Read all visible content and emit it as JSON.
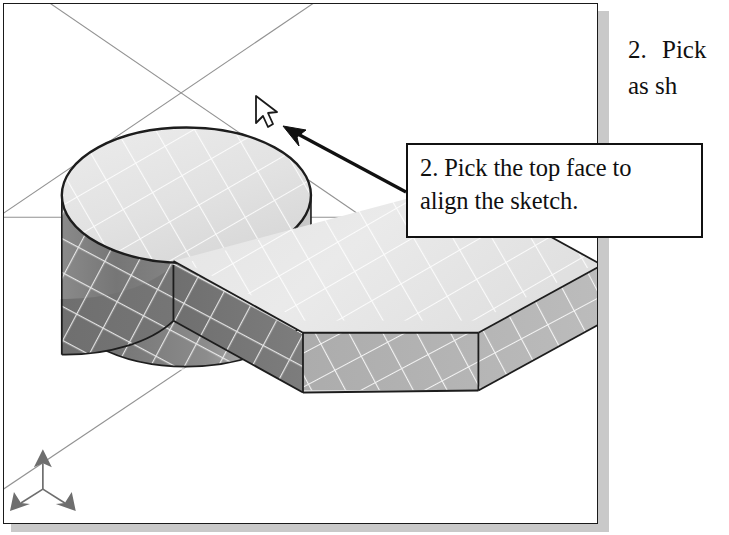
{
  "figure": {
    "kind": "cad-shaded-isometric-view",
    "caption_callout": {
      "line1": "2. Pick the top face to",
      "line2": "align the sketch."
    },
    "side_instruction": {
      "number": "2.",
      "line1": "Pick",
      "line2": "as sh"
    },
    "viewport": {
      "background_color": "#ffffff",
      "border_color": "#1a1a1a",
      "shadow_color": "#c9c9c9"
    },
    "model": {
      "name": "L-shaped base plate with cylindrical boss",
      "cylinder": {
        "top_face_label": "top face",
        "top_face_color": "#e2e2e2",
        "side_dark_color": "#777777",
        "side_light_color": "#bdbdbd",
        "edge_color": "#1d1d1d"
      },
      "block": {
        "top_face_color": "#e6e6e6",
        "front_face_color": "#737373",
        "right_face_color": "#b4b4b4",
        "edge_color": "#1d1d1d"
      },
      "grid_line_color": "#ffffff",
      "reference_axis_color": "#6a6a6a"
    },
    "annotation_arrow": {
      "color": "#111111",
      "tip_x": 287,
      "tip_y": 128,
      "tail_x": 406,
      "tail_y": 192
    },
    "cursor": {
      "icon": "mouse-pointer-icon",
      "x": 258,
      "y": 100,
      "fill_color": "#ffffff",
      "stroke_color": "#1a1a1a"
    },
    "axis_triad": {
      "icon": "coordinate-axis-triad-icon",
      "color": "#6e6e6e",
      "center_x": 42,
      "center_y": 490
    }
  }
}
